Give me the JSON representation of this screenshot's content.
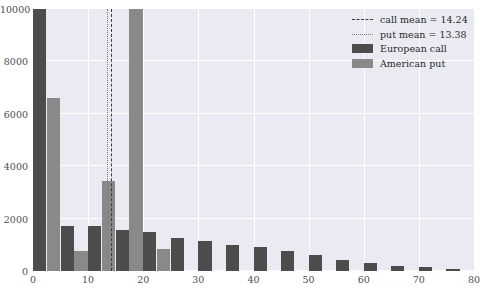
{
  "chart_data": {
    "type": "bar",
    "title": "",
    "xlabel": "",
    "ylabel": "",
    "xlim": [
      0,
      80
    ],
    "ylim": [
      0,
      10000
    ],
    "grid": true,
    "legend_position": "upper right",
    "xticks": [
      0,
      10,
      20,
      30,
      40,
      50,
      60,
      70,
      80
    ],
    "yticks": [
      0,
      2000,
      4000,
      6000,
      8000,
      10000
    ],
    "bin_width": 5,
    "bin_starts": [
      0,
      5,
      10,
      15,
      20,
      25,
      30,
      35,
      40,
      45,
      50,
      55,
      60,
      65,
      70,
      75
    ],
    "series": [
      {
        "name": "European call",
        "color": "#4c4c4c",
        "values": [
          10000,
          1700,
          1700,
          1550,
          1500,
          1250,
          1150,
          1000,
          900,
          750,
          600,
          420,
          300,
          200,
          140,
          90
        ]
      },
      {
        "name": "American put",
        "color": "#898989",
        "values": [
          6600,
          750,
          3450,
          10000,
          850,
          0,
          0,
          0,
          0,
          0,
          0,
          0,
          0,
          0,
          0,
          0
        ]
      }
    ],
    "vlines": [
      {
        "name": "call mean",
        "value": 14.24,
        "style": "dashed",
        "color": "#3a3a3a"
      },
      {
        "name": "put mean",
        "value": 13.38,
        "style": "dotted",
        "color": "#7d7d7d"
      }
    ]
  },
  "legend": {
    "items": [
      {
        "key": "line-dashed",
        "label": "call mean = 14.24"
      },
      {
        "key": "line-dotted",
        "label": "put mean = 13.38"
      },
      {
        "key": "swatch-call",
        "label": "European call"
      },
      {
        "key": "swatch-put",
        "label": "American put"
      }
    ]
  },
  "caption": {
    "text": ""
  }
}
